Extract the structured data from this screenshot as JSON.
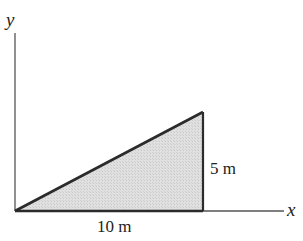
{
  "diagram": {
    "type": "right-triangle-on-axes",
    "axes": {
      "x_label": "x",
      "y_label": "y"
    },
    "triangle": {
      "vertices_px": [
        [
          15,
          211
        ],
        [
          203,
          211
        ],
        [
          203,
          112
        ]
      ],
      "fill": "#dcdcdc",
      "stroke": "#2b2b2b"
    },
    "dimensions": {
      "base": "10 m",
      "height": "5 m"
    },
    "colors": {
      "line": "#2b2b2b",
      "axis": "#555555",
      "fill": "#dcdcdc",
      "background": "#ffffff"
    }
  }
}
